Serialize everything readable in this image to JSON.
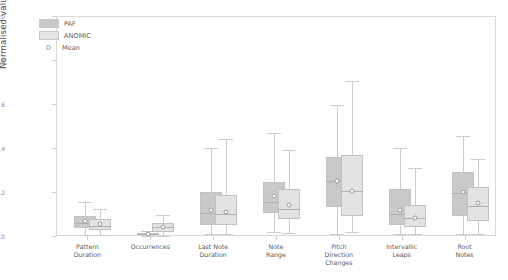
{
  "chart_data": {
    "type": "box",
    "title": "",
    "xlabel": "",
    "ylabel": "Normalised values",
    "ylim": [
      0.0,
      1.0
    ],
    "yticks": [
      0.0,
      0.2,
      0.4,
      0.6,
      0.8,
      1.0
    ],
    "ytick_labels": [
      "0.0",
      "0.2",
      "0.4",
      "0.6",
      "0.8",
      "1.0"
    ],
    "grid": false,
    "legend_position": "upper left",
    "categories": [
      "Pattern\nDuration",
      "Occurrences",
      "Last Note\nDuration",
      "Note\nRange",
      "Pitch\nDirection\nChanges",
      "Intervallic\nLeaps",
      "Root\nNotes"
    ],
    "series": [
      {
        "name": "PAF",
        "color": "#c9c9c9",
        "boxes": [
          {
            "category": "Pattern Duration",
            "whisker_low": 0.005,
            "q1": 0.035,
            "median": 0.06,
            "mean": 0.068,
            "q3": 0.09,
            "whisker_high": 0.155
          },
          {
            "category": "Occurrences",
            "whisker_low": 0.0,
            "q1": 0.004,
            "median": 0.008,
            "mean": 0.01,
            "q3": 0.012,
            "whisker_high": 0.022
          },
          {
            "category": "Last Note Duration",
            "whisker_low": 0.01,
            "q1": 0.05,
            "median": 0.105,
            "mean": 0.118,
            "q3": 0.2,
            "whisker_high": 0.4
          },
          {
            "category": "Note Range",
            "whisker_low": 0.02,
            "q1": 0.105,
            "median": 0.155,
            "mean": 0.18,
            "q3": 0.245,
            "whisker_high": 0.47
          },
          {
            "category": "Pitch Direction Changes",
            "whisker_low": 0.01,
            "q1": 0.13,
            "median": 0.25,
            "mean": 0.25,
            "q3": 0.36,
            "whisker_high": 0.595
          },
          {
            "category": "Intervallic Leaps",
            "whisker_low": 0.01,
            "q1": 0.05,
            "median": 0.1,
            "mean": 0.118,
            "q3": 0.215,
            "whisker_high": 0.4
          },
          {
            "category": "Root Notes",
            "whisker_low": 0.01,
            "q1": 0.09,
            "median": 0.195,
            "mean": 0.198,
            "q3": 0.29,
            "whisker_high": 0.455
          }
        ]
      },
      {
        "name": "ANOMIC",
        "color": "#e3e3e3",
        "boxes": [
          {
            "category": "Pattern Duration",
            "whisker_low": 0.005,
            "q1": 0.028,
            "median": 0.045,
            "mean": 0.055,
            "q3": 0.078,
            "whisker_high": 0.125
          },
          {
            "category": "Occurrences",
            "whisker_low": 0.0,
            "q1": 0.02,
            "median": 0.04,
            "mean": 0.042,
            "q3": 0.06,
            "whisker_high": 0.095
          },
          {
            "category": "Last Note Duration",
            "whisker_low": 0.008,
            "q1": 0.048,
            "median": 0.1,
            "mean": 0.11,
            "q3": 0.185,
            "whisker_high": 0.44
          },
          {
            "category": "Note Range",
            "whisker_low": 0.015,
            "q1": 0.075,
            "median": 0.125,
            "mean": 0.142,
            "q3": 0.215,
            "whisker_high": 0.39
          },
          {
            "category": "Pitch Direction Changes",
            "whisker_low": 0.02,
            "q1": 0.09,
            "median": 0.205,
            "mean": 0.205,
            "q3": 0.37,
            "whisker_high": 0.705
          },
          {
            "category": "Intervallic Leaps",
            "whisker_low": 0.008,
            "q1": 0.04,
            "median": 0.08,
            "mean": 0.082,
            "q3": 0.14,
            "whisker_high": 0.31
          },
          {
            "category": "Root Notes",
            "whisker_low": 0.008,
            "q1": 0.07,
            "median": 0.135,
            "mean": 0.15,
            "q3": 0.225,
            "whisker_high": 0.35
          }
        ]
      }
    ],
    "legend": [
      {
        "label": "PAF",
        "marker": "box",
        "color": "#c9c9c9"
      },
      {
        "label": "ANOMIC",
        "marker": "box",
        "color": "#e3e3e3"
      },
      {
        "label": "Mean",
        "marker": "circle-open",
        "color": "#ffffff"
      }
    ]
  }
}
